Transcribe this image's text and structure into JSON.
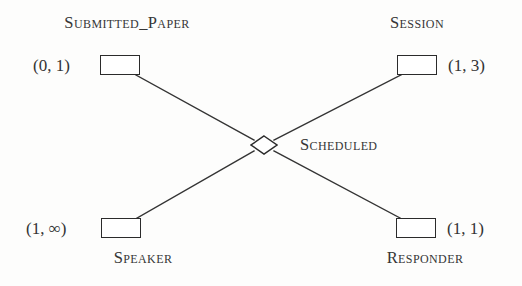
{
  "diagram": {
    "notation": "Chen ER diagram with (min, max) cardinality constraints",
    "relationship": {
      "label": "Scheduled",
      "shape": "diamond"
    },
    "entities": [
      {
        "id": "submitted-paper",
        "label": "Submitted_Paper",
        "cardinality": "(0, 1)",
        "position": "top-left"
      },
      {
        "id": "session",
        "label": "Session",
        "cardinality": "(1, 3)",
        "position": "top-right"
      },
      {
        "id": "speaker",
        "label": "Speaker",
        "cardinality": "(1, ∞)",
        "position": "bottom-left"
      },
      {
        "id": "responder",
        "label": "Responder",
        "cardinality": "(1, 1)",
        "position": "bottom-right"
      }
    ],
    "colors": {
      "line": "#343434",
      "box_border": "#2b2b2b",
      "text": "#363636",
      "background": "#fdfdfc"
    }
  }
}
